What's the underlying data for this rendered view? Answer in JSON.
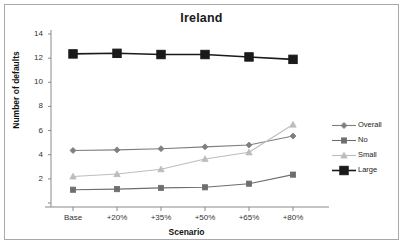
{
  "chart_data": {
    "type": "line",
    "title": "Ireland",
    "xlabel": "Scenario",
    "ylabel": "Number of defaults",
    "categories": [
      "Base",
      "+20%",
      "+35%",
      "+50%",
      "+65%",
      "+80%"
    ],
    "ylim": [
      0,
      14
    ],
    "yticks": [
      0,
      2,
      4,
      6,
      8,
      10,
      12,
      14
    ],
    "ytick_labels": [
      "",
      "2",
      "4",
      "6",
      "8",
      "10",
      "12",
      "14"
    ],
    "grid": false,
    "legend_position": "right",
    "series": [
      {
        "name": "Overall",
        "marker": "diamond",
        "color": "#7f7f7f",
        "values": [
          4.35,
          4.4,
          4.5,
          4.65,
          4.8,
          5.55
        ]
      },
      {
        "name": "No",
        "marker": "square",
        "color": "#6e6e6e",
        "values": [
          1.1,
          1.15,
          1.25,
          1.3,
          1.6,
          2.35
        ]
      },
      {
        "name": "Small",
        "marker": "triangle",
        "color": "#bdbdbd",
        "values": [
          2.2,
          2.4,
          2.8,
          3.65,
          4.2,
          6.5
        ]
      },
      {
        "name": "Large",
        "marker": "square-large",
        "color": "#1a1a1a",
        "values": [
          12.35,
          12.4,
          12.3,
          12.3,
          12.1,
          11.9
        ]
      }
    ]
  },
  "legend": {
    "items": [
      {
        "label": "Overall"
      },
      {
        "label": "No"
      },
      {
        "label": "Small"
      },
      {
        "label": "Large"
      }
    ]
  }
}
